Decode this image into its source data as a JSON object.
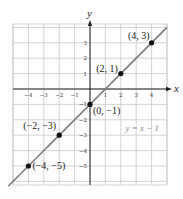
{
  "chart_data": {
    "type": "line",
    "title": "",
    "xlabel": "x",
    "ylabel": "y",
    "xlim": [
      -5,
      5
    ],
    "ylim": [
      -6,
      4
    ],
    "grid": true,
    "x_ticks": [
      -4,
      -3,
      -2,
      -1,
      1,
      2,
      3,
      4
    ],
    "y_ticks": [
      3,
      2,
      1,
      -1,
      -2,
      -3,
      -4,
      -5
    ],
    "x_tick_labels": [
      "-4",
      "-3",
      "-2",
      "-1",
      "1",
      "2",
      "3",
      "4"
    ],
    "y_tick_labels": [
      "3",
      "2",
      "1",
      "-1",
      "-2",
      "-3",
      "-4",
      "-5"
    ],
    "series": [
      {
        "name": "y = x − 1",
        "equation": "y = x − 1",
        "slope": 1,
        "intercept": -1,
        "color": "#7a7a7a"
      }
    ],
    "points": [
      {
        "x": 4,
        "y": 3,
        "label": "(4, 3)"
      },
      {
        "x": 2,
        "y": 1,
        "label": "(2, 1)"
      },
      {
        "x": 0,
        "y": -1,
        "label": "(0, −1)"
      },
      {
        "x": -2,
        "y": -3,
        "label": "(−2, −3)"
      },
      {
        "x": -4,
        "y": -5,
        "label": "(−4, −5)"
      }
    ],
    "annotations": [
      {
        "text": "y = x − 1",
        "x": 2.3,
        "y": -2.7
      }
    ]
  },
  "colors": {
    "grid": "#c8c8c8",
    "axis": "#222222",
    "line": "#7a7a7a",
    "point": "#111111",
    "equation": "#8a8a8a"
  }
}
